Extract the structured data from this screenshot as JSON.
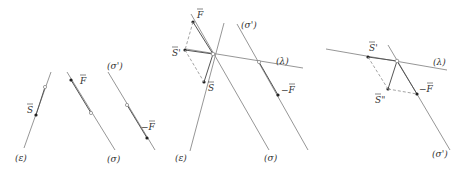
{
  "figure": {
    "panels": [
      {
        "id": "panel-1",
        "labels": {
          "line_epsilon": "(ε)",
          "line_sigma": "(σ)",
          "line_sigma_prime": "(σ')",
          "vec_S": "S",
          "vec_F": "F",
          "vec_minus_F": "−F"
        }
      },
      {
        "id": "panel-2",
        "labels": {
          "line_epsilon": "(ε)",
          "line_sigma": "(σ)",
          "line_sigma_prime": "(σ')",
          "line_lambda": "(λ)",
          "vec_S": "S",
          "vec_S_prime": "S'",
          "vec_F": "F",
          "vec_minus_F": "−F"
        }
      },
      {
        "id": "panel-3",
        "labels": {
          "line_sigma_prime": "(σ')",
          "line_lambda": "(λ)",
          "vec_S_prime": "S'",
          "vec_S_double_prime": "S\"",
          "vec_minus_F": "−F"
        }
      }
    ]
  },
  "colors": {
    "line": "#8a8a8a",
    "point": "#222222",
    "text": "#333333",
    "background": "#ffffff"
  }
}
